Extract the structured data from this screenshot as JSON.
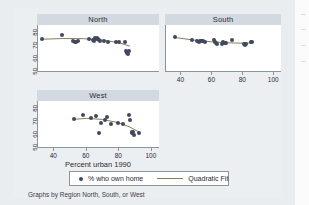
{
  "figure": {
    "caption": "Graphs by Region North, South, or West",
    "xlabel": "Percent urban 1990",
    "background_color": "#eceff2",
    "panel_title_color": "#d2d9e0",
    "marker_color": "#41485f",
    "fit_line_color": "#8a7d55"
  },
  "legend": {
    "marker_icon": "filled-circle-marker",
    "marker_label": "% who own home",
    "line_icon": "fit-line-swatch",
    "line_label": "Quadratic Fit"
  },
  "chart_data": {
    "type": "scatter",
    "title": "",
    "xlabel": "Percent urban 1990",
    "ylabel": "% who own home",
    "xlim": [
      30,
      105
    ],
    "ylim": [
      47,
      83
    ],
    "xticks": [
      40,
      60,
      80,
      100
    ],
    "yticks": [
      50,
      60,
      70,
      80
    ],
    "grid": false,
    "legend_position": "bottom",
    "legend_entries": [
      "% who own home",
      "Quadratic Fit"
    ],
    "panels": [
      {
        "name": "North",
        "show_yaxis": true,
        "show_xaxis": false,
        "points": [
          {
            "x": 32.2,
            "y": 72.0
          },
          {
            "x": 44.6,
            "y": 74.8
          },
          {
            "x": 51.6,
            "y": 70.2
          },
          {
            "x": 52.7,
            "y": 69.6
          },
          {
            "x": 53.3,
            "y": 70.0
          },
          {
            "x": 54.6,
            "y": 70.6
          },
          {
            "x": 61.9,
            "y": 72.4
          },
          {
            "x": 64.2,
            "y": 71.2
          },
          {
            "x": 65.0,
            "y": 70.8
          },
          {
            "x": 65.6,
            "y": 72.6
          },
          {
            "x": 66.2,
            "y": 71.8
          },
          {
            "x": 66.7,
            "y": 73.0
          },
          {
            "x": 67.0,
            "y": 72.0
          },
          {
            "x": 67.6,
            "y": 71.0
          },
          {
            "x": 68.2,
            "y": 70.4
          },
          {
            "x": 70.6,
            "y": 70.4
          },
          {
            "x": 73.4,
            "y": 69.8
          },
          {
            "x": 78.1,
            "y": 69.6
          },
          {
            "x": 80.2,
            "y": 69.8
          },
          {
            "x": 84.1,
            "y": 69.4
          },
          {
            "x": 84.6,
            "y": 62.4
          },
          {
            "x": 85.0,
            "y": 61.0
          },
          {
            "x": 85.4,
            "y": 62.0
          },
          {
            "x": 85.8,
            "y": 60.6
          },
          {
            "x": 86.2,
            "y": 63.0
          }
        ],
        "fit": [
          {
            "x": 32.0,
            "y": 71.8
          },
          {
            "x": 45.0,
            "y": 72.4
          },
          {
            "x": 58.0,
            "y": 72.3
          },
          {
            "x": 70.0,
            "y": 71.2
          },
          {
            "x": 80.0,
            "y": 69.2
          },
          {
            "x": 87.0,
            "y": 66.4
          }
        ]
      },
      {
        "name": "South",
        "show_yaxis": false,
        "show_xaxis": true,
        "points": [
          {
            "x": 36.0,
            "y": 73.8
          },
          {
            "x": 46.8,
            "y": 71.6
          },
          {
            "x": 50.3,
            "y": 70.6
          },
          {
            "x": 51.2,
            "y": 70.0
          },
          {
            "x": 52.0,
            "y": 70.4
          },
          {
            "x": 52.8,
            "y": 70.8
          },
          {
            "x": 53.6,
            "y": 70.2
          },
          {
            "x": 54.4,
            "y": 70.6
          },
          {
            "x": 55.2,
            "y": 70.0
          },
          {
            "x": 61.5,
            "y": 71.2
          },
          {
            "x": 62.0,
            "y": 70.0
          },
          {
            "x": 62.6,
            "y": 68.6
          },
          {
            "x": 63.4,
            "y": 67.8
          },
          {
            "x": 66.6,
            "y": 68.4
          },
          {
            "x": 67.4,
            "y": 69.4
          },
          {
            "x": 68.2,
            "y": 69.0
          },
          {
            "x": 69.0,
            "y": 69.2
          },
          {
            "x": 73.2,
            "y": 71.4
          },
          {
            "x": 80.8,
            "y": 68.4
          },
          {
            "x": 81.4,
            "y": 67.2
          },
          {
            "x": 82.0,
            "y": 68.0
          },
          {
            "x": 85.2,
            "y": 69.6
          },
          {
            "x": 86.0,
            "y": 69.4
          }
        ],
        "fit": [
          {
            "x": 36.0,
            "y": 73.2
          },
          {
            "x": 48.0,
            "y": 71.2
          },
          {
            "x": 60.0,
            "y": 69.8
          },
          {
            "x": 72.0,
            "y": 69.0
          },
          {
            "x": 80.0,
            "y": 68.8
          },
          {
            "x": 86.0,
            "y": 69.0
          }
        ]
      },
      {
        "name": "West",
        "show_yaxis": true,
        "show_xaxis": true,
        "points": [
          {
            "x": 52.4,
            "y": 69.0
          },
          {
            "x": 57.8,
            "y": 72.4
          },
          {
            "x": 62.8,
            "y": 70.0
          },
          {
            "x": 66.2,
            "y": 71.0
          },
          {
            "x": 67.6,
            "y": 57.6
          },
          {
            "x": 69.0,
            "y": 65.4
          },
          {
            "x": 71.4,
            "y": 68.2
          },
          {
            "x": 73.0,
            "y": 70.2
          },
          {
            "x": 75.2,
            "y": 65.2
          },
          {
            "x": 79.4,
            "y": 65.6
          },
          {
            "x": 82.6,
            "y": 65.0
          },
          {
            "x": 86.6,
            "y": 72.0
          },
          {
            "x": 87.2,
            "y": 68.0
          },
          {
            "x": 88.0,
            "y": 59.0
          },
          {
            "x": 88.4,
            "y": 57.6
          },
          {
            "x": 88.8,
            "y": 58.6
          },
          {
            "x": 89.2,
            "y": 56.4
          },
          {
            "x": 92.4,
            "y": 58.2
          }
        ],
        "fit": [
          {
            "x": 52.0,
            "y": 68.6
          },
          {
            "x": 60.0,
            "y": 69.4
          },
          {
            "x": 70.0,
            "y": 68.6
          },
          {
            "x": 80.0,
            "y": 66.0
          },
          {
            "x": 87.0,
            "y": 62.6
          },
          {
            "x": 93.0,
            "y": 58.4
          }
        ]
      }
    ]
  }
}
